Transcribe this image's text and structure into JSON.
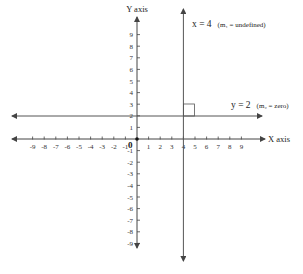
{
  "diagram": {
    "type": "coordinate-plane",
    "x_axis_label": "X axis",
    "y_axis_label": "Y axis",
    "origin_label": "0",
    "x_ticks": [
      "-9",
      "-8",
      "-7",
      "-6",
      "-5",
      "-4",
      "-3",
      "-2",
      "-1",
      "1",
      "2",
      "3",
      "4",
      "5",
      "6",
      "7",
      "8",
      "9"
    ],
    "y_ticks_positive": [
      "9",
      "8",
      "7",
      "6",
      "5",
      "4",
      "3",
      "2",
      "1"
    ],
    "y_ticks_negative": [
      "-1",
      "-2",
      "-3",
      "-4",
      "-5",
      "-6",
      "-7",
      "-8",
      "-9"
    ],
    "vertical_line": {
      "equation_main": "x = 4",
      "equation_note": "(m₁ = undefined)"
    },
    "horizontal_line": {
      "equation_main": "y = 2",
      "equation_note": "(m₂ = zero)"
    },
    "colors": {
      "axis": "#444444",
      "line": "#555555",
      "background": "#ffffff"
    }
  }
}
